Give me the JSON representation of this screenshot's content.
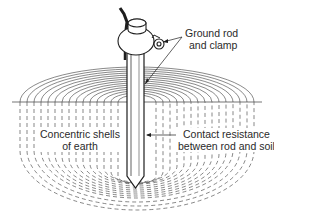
{
  "figure": {
    "labels": {
      "ground_rod_clamp": {
        "line1": "Ground rod",
        "line2": "and clamp"
      },
      "concentric_shells": {
        "line1": "Concentric shells",
        "line2": "of earth"
      },
      "contact_resistance": {
        "line1": "Contact resistance",
        "line2": "between rod and soil"
      }
    },
    "colors": {
      "ink": "#2a2a2a",
      "background": "#ffffff",
      "dash": "#555555"
    }
  }
}
